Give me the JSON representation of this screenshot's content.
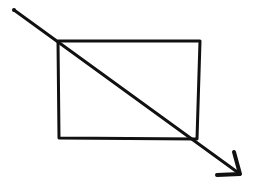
{
  "diagram": {
    "background": "#ffffff",
    "ink_color": "#111111",
    "stroke_width": 3,
    "rectangle": {
      "top_left": [
        58,
        41
      ],
      "top_right": [
        200,
        41
      ],
      "bottom_right": [
        197,
        139
      ],
      "bottom_left": [
        59,
        138
      ]
    },
    "arrow": {
      "start": [
        14,
        10
      ],
      "tip": [
        240,
        174
      ],
      "head_wing_1": [
        234,
        152
      ],
      "head_wing_2": [
        217,
        175
      ]
    }
  }
}
